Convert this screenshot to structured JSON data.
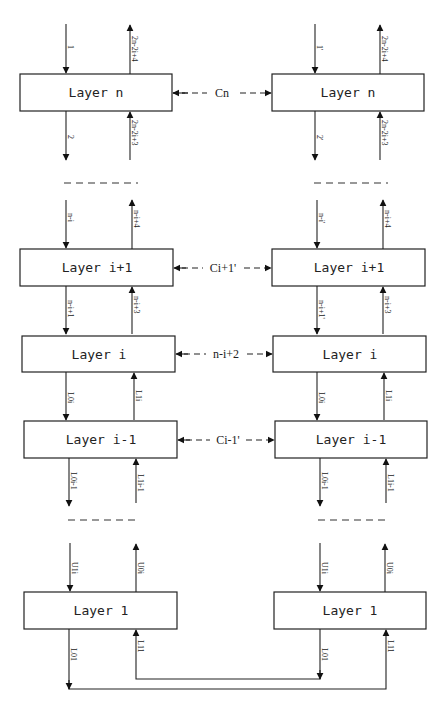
{
  "diagram": {
    "left_column": {
      "layers": [
        {
          "label": "Layer n",
          "in_top": "1",
          "out_top": "2n-2i+4",
          "out_bottom": "2",
          "in_bottom": "2n-2i+3"
        },
        {
          "label": "Layer i+1",
          "in_top": "n-i",
          "out_top": "n-i+4",
          "out_bottom": "n-i+1",
          "in_bottom": "n-i+3"
        },
        {
          "label": "Layer i",
          "out_bottom": "L0i",
          "in_bottom": "L1i"
        },
        {
          "label": "Layer i-1",
          "out_bottom": "L0i-1",
          "in_bottom": "L1i-1"
        },
        {
          "label": "Layer 1",
          "in_top": "U1i",
          "out_top": "U0i",
          "out_bottom": "L01",
          "in_bottom": "L11"
        }
      ]
    },
    "right_column": {
      "layers": [
        {
          "label": "Layer n",
          "in_top": "1'",
          "out_top": "2n-2i+4",
          "out_bottom": "2'",
          "in_bottom": "2n-2i+3"
        },
        {
          "label": "Layer i+1",
          "in_top": "n-i'",
          "out_top": "n-i+4",
          "out_bottom": "n-i+1'",
          "in_bottom": "n-i+3"
        },
        {
          "label": "Layer i",
          "out_bottom": "L0i",
          "in_bottom": "L1i"
        },
        {
          "label": "Layer i-1",
          "out_bottom": "L0i-1",
          "in_bottom": "L1i-1"
        },
        {
          "label": "Layer 1",
          "in_top": "U1i",
          "out_top": "U0i",
          "out_bottom": "L01",
          "in_bottom": "L11"
        }
      ]
    },
    "connections": [
      {
        "label": "Cn"
      },
      {
        "label": "Ci+1'"
      },
      {
        "label": "n-i+2"
      },
      {
        "label": "Ci-1'"
      }
    ]
  }
}
